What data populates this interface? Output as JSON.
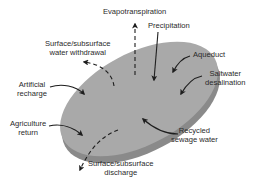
{
  "diagram": {
    "colors": {
      "top_face": "#a9a9a9",
      "side_face": "#8a8a8a",
      "arrow": "#1e1e1e",
      "text": "#2a2a2a"
    },
    "labels": {
      "evapotranspiration": "Evapotranspiration",
      "precipitation": "Precipitation",
      "withdrawal": "Surface/subsurface\nwater withdrawal",
      "aqueduct": "Aqueduct",
      "desalination": "Saltwater\ndesalination",
      "artificial_recharge": "Artificial\nrecharge",
      "agriculture_return": "Agriculture\nreturn",
      "recycled_sewage": "Recycled\nsewage water",
      "discharge": "Surface/subsurface\ndischarge"
    },
    "flows": [
      {
        "name": "Evapotranspiration",
        "direction": "out",
        "style": "dashed"
      },
      {
        "name": "Precipitation",
        "direction": "in",
        "style": "solid"
      },
      {
        "name": "Surface/subsurface water withdrawal",
        "direction": "out",
        "style": "dashed"
      },
      {
        "name": "Aqueduct",
        "direction": "in",
        "style": "solid"
      },
      {
        "name": "Saltwater desalination",
        "direction": "in",
        "style": "solid"
      },
      {
        "name": "Artificial recharge",
        "direction": "in",
        "style": "solid"
      },
      {
        "name": "Agriculture return",
        "direction": "in",
        "style": "solid"
      },
      {
        "name": "Recycled sewage water",
        "direction": "in",
        "style": "solid"
      },
      {
        "name": "Surface/subsurface discharge",
        "direction": "out",
        "style": "dashed"
      }
    ]
  }
}
